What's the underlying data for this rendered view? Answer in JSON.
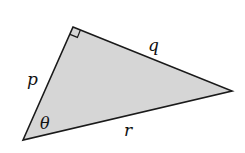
{
  "diagram": {
    "type": "right-triangle",
    "fill_color": "#d6d6d6",
    "stroke_color": "#1a1a1a",
    "vertices": {
      "right_angle": [
        73,
        27
      ],
      "theta_vertex": [
        23,
        140
      ],
      "far_vertex": [
        232,
        91
      ]
    },
    "labels": {
      "p": "p",
      "q": "q",
      "r": "r",
      "theta": "θ"
    },
    "right_angle_marker": true
  }
}
